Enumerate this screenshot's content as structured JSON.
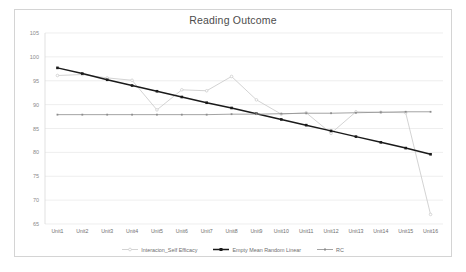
{
  "chart_data": {
    "type": "line",
    "title": "Reading Outcome",
    "xlabel": "",
    "ylabel": "",
    "ylim": [
      65,
      105
    ],
    "yticks": [
      65,
      70,
      75,
      80,
      85,
      90,
      95,
      100,
      105
    ],
    "grid": true,
    "legend_position": "bottom",
    "categories": [
      "Unit1",
      "Unit2",
      "Unit3",
      "Unit4",
      "Unit5",
      "Unit6",
      "Unit7",
      "Unit8",
      "Unit9",
      "Unit10",
      "Unit11",
      "Unit12",
      "Unit13",
      "Unit14",
      "Unit15",
      "Unit16"
    ],
    "series": [
      {
        "name": "Interacion_Self Efficacy",
        "color": "#c8c8c8",
        "marker": "circle",
        "values": [
          96.1,
          96.3,
          95.6,
          95.1,
          88.9,
          93.1,
          92.9,
          95.9,
          91.0,
          88.0,
          88.3,
          84.0,
          88.5,
          88.4,
          88.3,
          67.0
        ]
      },
      {
        "name": "Empty Mean Random Linear",
        "color": "#1a1a1a",
        "marker": "square",
        "values": [
          97.7,
          96.5,
          95.2,
          94.0,
          92.8,
          91.6,
          90.4,
          89.3,
          88.1,
          86.9,
          85.7,
          84.5,
          83.3,
          82.1,
          80.9,
          79.6
        ]
      },
      {
        "name": "RC",
        "color": "#8c8c8c",
        "marker": "square",
        "values": [
          87.9,
          87.9,
          87.9,
          87.9,
          87.9,
          87.9,
          87.9,
          88.0,
          88.0,
          88.1,
          88.2,
          88.2,
          88.3,
          88.4,
          88.5,
          88.5
        ]
      }
    ]
  }
}
